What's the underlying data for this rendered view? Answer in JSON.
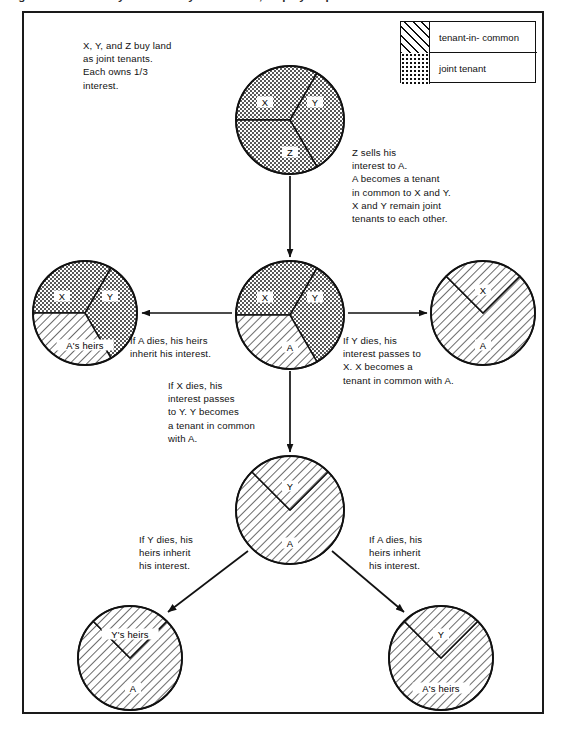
{
  "page": {
    "clipped_header": "Figure: Joint tenancy and tenancy in common, step by step"
  },
  "legend": {
    "title": "legend",
    "items": [
      {
        "pattern": "hatch",
        "label": "tenant-in- common"
      },
      {
        "pattern": "dots",
        "label": "joint tenant"
      }
    ]
  },
  "captions": {
    "intro": "X, Y, and Z buy land\nas joint tenants.\nEach owns 1/3\ninterest.",
    "z_sells": "Z sells his\ninterest to A.\nA becomes a tenant\nin common to X and Y.\nX and Y remain joint\ntenants to each other.",
    "a_dies": "If A dies, his heirs\ninherit his interest.",
    "y_dies": "If Y dies, his\ninterest passes to\nX. X becomes a\ntenant in common with A.",
    "x_dies": "If X dies, his\ninterest passes\nto Y. Y becomes\na tenant in common\nwith A.",
    "y_dies_2": "If Y dies, his\nheirs inherit\nhis interest.",
    "a_dies_2": "If A dies, his\nheirs inherit\nhis interest."
  },
  "circles": {
    "top": {
      "name": "xyz-joint-tenants",
      "cx": 290,
      "cy": 120,
      "r": 54,
      "sectors": [
        {
          "label": "X",
          "pattern": "dots",
          "start": 180,
          "end": 300,
          "lx": 265,
          "ly": 102
        },
        {
          "label": "Y",
          "pattern": "dots",
          "start": 300,
          "end": 60,
          "lx": 315,
          "ly": 102
        },
        {
          "label": "Z",
          "pattern": "dots",
          "start": 60,
          "end": 180,
          "lx": 290,
          "ly": 152
        }
      ]
    },
    "center": {
      "name": "xy-joint-a-common",
      "cx": 290,
      "cy": 315,
      "r": 54,
      "sectors": [
        {
          "label": "X",
          "pattern": "dots",
          "start": 180,
          "end": 300,
          "lx": 265,
          "ly": 297
        },
        {
          "label": "Y",
          "pattern": "dots",
          "start": 300,
          "end": 60,
          "lx": 315,
          "ly": 297
        },
        {
          "label": "A",
          "pattern": "hatch",
          "start": 60,
          "end": 180,
          "lx": 290,
          "ly": 347
        }
      ]
    },
    "left": {
      "name": "xy-joint-a-heirs-common",
      "cx": 85,
      "cy": 313,
      "r": 52,
      "sectors": [
        {
          "label": "X",
          "pattern": "dots",
          "start": 180,
          "end": 300,
          "lx": 62,
          "ly": 296
        },
        {
          "label": "Y",
          "pattern": "dots",
          "start": 300,
          "end": 60,
          "lx": 110,
          "ly": 296
        },
        {
          "label": "A's heirs",
          "pattern": "hatch",
          "start": 60,
          "end": 180,
          "lx": 85,
          "ly": 345
        }
      ]
    },
    "right": {
      "name": "x-and-a-tenants-in-common",
      "cx": 483,
      "cy": 313,
      "r": 52,
      "sectors": [
        {
          "label": "X",
          "pattern": "hatch",
          "start": 315,
          "end": 225,
          "lx": 483,
          "ly": 290
        },
        {
          "label": "A",
          "pattern": "hatch",
          "start": 225,
          "end": 315,
          "lx": 483,
          "ly": 345
        }
      ]
    },
    "middle_lower": {
      "name": "y-and-a-tenants-in-common",
      "cx": 290,
      "cy": 510,
      "r": 54,
      "sectors": [
        {
          "label": "Y",
          "pattern": "hatch",
          "start": 315,
          "end": 225,
          "lx": 290,
          "ly": 486
        },
        {
          "label": "A",
          "pattern": "hatch",
          "start": 225,
          "end": 315,
          "lx": 290,
          "ly": 543
        }
      ]
    },
    "bottom_left": {
      "name": "y-heirs-and-a-tenants-in-common",
      "cx": 130,
      "cy": 658,
      "r": 52,
      "sectors": [
        {
          "label": "Y's heirs",
          "pattern": "hatch",
          "start": 315,
          "end": 225,
          "lx": 130,
          "ly": 634
        },
        {
          "label": "A",
          "pattern": "hatch",
          "start": 225,
          "end": 315,
          "lx": 133,
          "ly": 688
        }
      ]
    },
    "bottom_right": {
      "name": "y-and-a-heirs-tenants-in-common",
      "cx": 441,
      "cy": 658,
      "r": 52,
      "sectors": [
        {
          "label": "Y",
          "pattern": "hatch",
          "start": 315,
          "end": 225,
          "lx": 441,
          "ly": 634
        },
        {
          "label": "A's heirs",
          "pattern": "hatch",
          "start": 225,
          "end": 315,
          "lx": 441,
          "ly": 688
        }
      ]
    }
  },
  "arrows": [
    {
      "name": "arrow-top-to-center",
      "x1": 290,
      "y1": 176,
      "x2": 290,
      "y2": 257
    },
    {
      "name": "arrow-center-to-left",
      "x1": 232,
      "y1": 313,
      "x2": 142,
      "y2": 313
    },
    {
      "name": "arrow-center-to-right",
      "x1": 348,
      "y1": 313,
      "x2": 427,
      "y2": 313
    },
    {
      "name": "arrow-center-to-lower",
      "x1": 290,
      "y1": 371,
      "x2": 290,
      "y2": 452
    },
    {
      "name": "arrow-lower-to-bottomleft",
      "x1": 248,
      "y1": 551,
      "x2": 168,
      "y2": 612
    },
    {
      "name": "arrow-lower-to-bottomright",
      "x1": 332,
      "y1": 551,
      "x2": 404,
      "y2": 612
    }
  ],
  "colors": {
    "ink": "#111111",
    "frame": "#1a1a1a",
    "paper": "#ffffff"
  }
}
